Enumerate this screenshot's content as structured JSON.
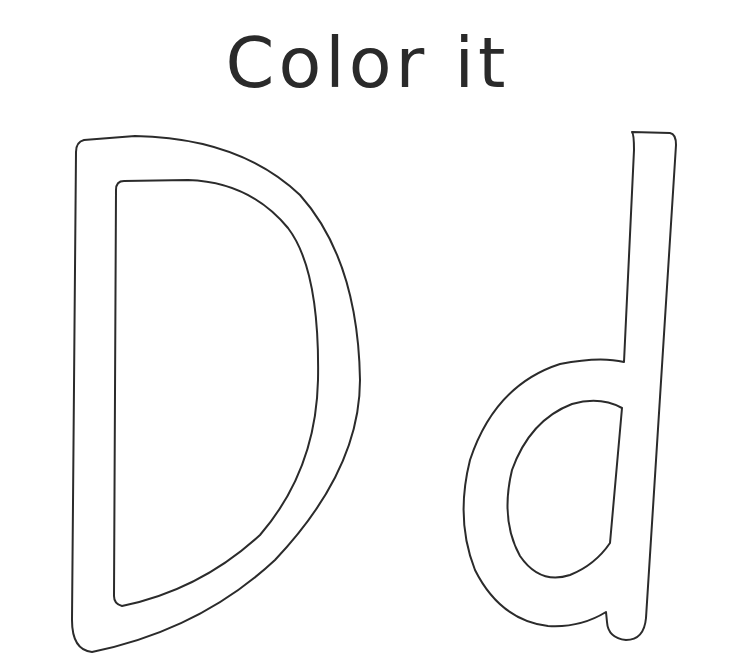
{
  "title": "Color it",
  "letters": {
    "uppercase": "D",
    "lowercase": "d"
  },
  "colors": {
    "outline": "#2b2b2b",
    "background": "#ffffff"
  }
}
